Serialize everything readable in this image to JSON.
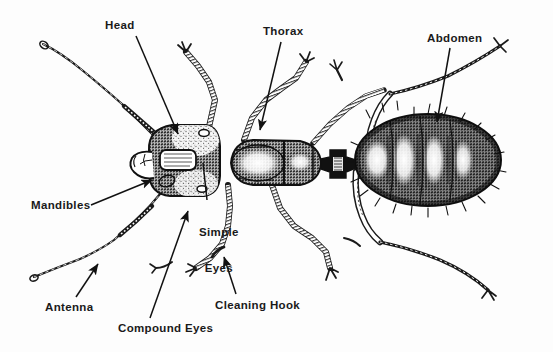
{
  "figure": {
    "subject": "ant",
    "view": "dorsal (top) view",
    "style": "black-and-white stipple engraving line illustration",
    "background_color": "#fdfdfd",
    "ink_color": "#1a1a1a"
  },
  "labels": [
    {
      "id": "head",
      "text": "Head",
      "x": 105,
      "y": 19,
      "lines": [
        "Head"
      ]
    },
    {
      "id": "thorax",
      "text": "Thorax",
      "x": 263,
      "y": 25,
      "lines": [
        "Thorax"
      ]
    },
    {
      "id": "abdomen",
      "text": "Abdomen",
      "x": 427,
      "y": 32,
      "lines": [
        "Abdomen"
      ]
    },
    {
      "id": "mandibles",
      "text": "Mandibles",
      "x": 31,
      "y": 199,
      "lines": [
        "Mandibles"
      ]
    },
    {
      "id": "simple-eyes",
      "text": "Simple Eyes",
      "x": 199,
      "y": 202,
      "lines": [
        "Simple",
        "Eyes"
      ]
    },
    {
      "id": "antenna",
      "text": "Antenna",
      "x": 45,
      "y": 301,
      "lines": [
        "Antenna"
      ]
    },
    {
      "id": "cleaning-hook",
      "text": "Cleaning Hook",
      "x": 215,
      "y": 299,
      "lines": [
        "Cleaning Hook"
      ]
    },
    {
      "id": "compound-eyes",
      "text": "Compound Eyes",
      "x": 118,
      "y": 322,
      "lines": [
        "Compound Eyes"
      ]
    }
  ],
  "leaders": [
    {
      "id": "head-leader",
      "label": "Head",
      "from": [
        136,
        36
      ],
      "to": [
        178,
        134
      ],
      "arrow": true
    },
    {
      "id": "thorax-leader",
      "label": "Thorax",
      "from": [
        281,
        42
      ],
      "to": [
        260,
        130
      ],
      "arrow": true
    },
    {
      "id": "abdomen-leader",
      "label": "Abdomen",
      "from": [
        450,
        48
      ],
      "to": [
        437,
        122
      ],
      "arrow": true
    },
    {
      "id": "mandibles-leader",
      "label": "Mandibles",
      "from": [
        91,
        205
      ],
      "to": [
        152,
        180
      ],
      "arrow": true
    },
    {
      "id": "simple-eyes-leader",
      "label": "Simple Eyes",
      "from": [
        207,
        200
      ],
      "to": [
        203,
        163
      ],
      "arrow": false
    },
    {
      "id": "antenna-leader",
      "label": "Antenna",
      "from": [
        76,
        297
      ],
      "to": [
        98,
        264
      ],
      "arrow": true
    },
    {
      "id": "cleaning-hook-leader",
      "label": "Cleaning Hook",
      "from": [
        236,
        294
      ],
      "to": [
        224,
        257
      ],
      "arrow": true
    },
    {
      "id": "compound-eyes-leader",
      "label": "Compound Eyes",
      "from": [
        150,
        318
      ],
      "to": [
        188,
        211
      ],
      "arrow": true
    }
  ],
  "body_parts": [
    {
      "id": "head",
      "name": "Head",
      "center": [
        182,
        160
      ],
      "size": [
        78,
        72
      ]
    },
    {
      "id": "thorax",
      "name": "Thorax",
      "center": [
        274,
        162
      ],
      "size": [
        96,
        50
      ]
    },
    {
      "id": "petiole",
      "name": "Petiole (waist)",
      "center": [
        338,
        165
      ],
      "size": [
        22,
        22
      ]
    },
    {
      "id": "abdomen",
      "name": "Abdomen",
      "center": [
        428,
        160
      ],
      "size": [
        146,
        92
      ]
    }
  ],
  "appendages": {
    "antennae": 2,
    "legs": 6,
    "mandibles": 2,
    "simple_eyes": 2,
    "compound_eyes": 2,
    "cleaning_hooks": 1
  }
}
